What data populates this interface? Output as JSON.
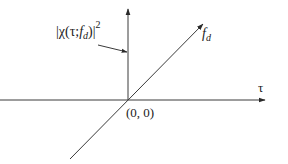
{
  "diagram": {
    "type": "3d-axes",
    "colors": {
      "line": "#3a3a3a",
      "text": "#222222",
      "background": "#ffffff"
    },
    "labels": {
      "vertical_axis": "|χ(τ;f_d)|²",
      "vertical_main": "|χ(τ;",
      "vertical_sub_f": "f",
      "vertical_sub_d": "d",
      "vertical_close": ")|",
      "vertical_exp": "2",
      "diagonal_axis_f": "f",
      "diagonal_axis_d": "d",
      "horizontal_axis": "τ",
      "origin": "(0, 0)"
    },
    "axes": [
      {
        "name": "amplitude",
        "direction": "up"
      },
      {
        "name": "tau",
        "direction": "right"
      },
      {
        "name": "doppler",
        "direction": "diagonal-up-right"
      }
    ]
  }
}
